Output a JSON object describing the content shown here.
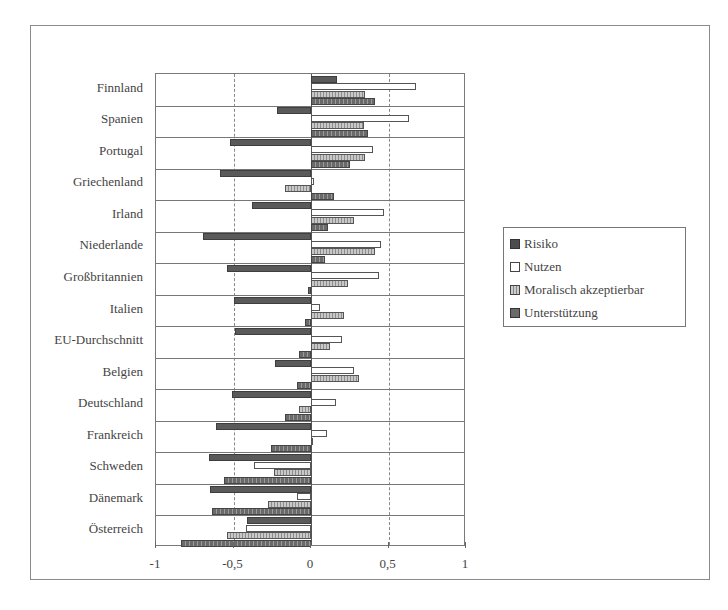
{
  "chart_data": {
    "type": "bar",
    "orientation": "horizontal",
    "title": "",
    "xlabel": "",
    "ylabel": "",
    "xlim": [
      -1,
      1
    ],
    "x_ticks": [
      "-1",
      "-0,5",
      "0",
      "0,5",
      "1"
    ],
    "x_tick_values": [
      -1,
      -0.5,
      0,
      0.5,
      1
    ],
    "grid": "vertical dashed at -0.5 and 0.5",
    "legend_position": "right",
    "categories": [
      "Finnland",
      "Spanien",
      "Portugal",
      "Griechenland",
      "Irland",
      "Niederlande",
      "Großbritannien",
      "Italien",
      "EU-Durchschnitt",
      "Belgien",
      "Deutschland",
      "Frankreich",
      "Schweden",
      "Dänemark",
      "Österreich"
    ],
    "series": [
      {
        "name": "Risiko",
        "values": [
          0.17,
          -0.22,
          -0.52,
          -0.59,
          -0.38,
          -0.7,
          -0.54,
          -0.5,
          -0.49,
          -0.23,
          -0.51,
          -0.61,
          -0.66,
          -0.65,
          -0.41
        ]
      },
      {
        "name": "Nutzen",
        "values": [
          0.68,
          0.63,
          0.4,
          0.02,
          0.47,
          0.45,
          0.44,
          0.06,
          0.2,
          0.28,
          0.16,
          0.1,
          -0.37,
          -0.09,
          -0.42
        ]
      },
      {
        "name": "Moralisch akzeptierbar",
        "values": [
          0.35,
          0.34,
          0.35,
          -0.17,
          0.28,
          0.41,
          0.24,
          0.21,
          0.12,
          0.31,
          -0.08,
          0.0,
          -0.24,
          -0.28,
          -0.54
        ]
      },
      {
        "name": "Unterstützung",
        "values": [
          0.41,
          0.37,
          0.25,
          0.15,
          0.11,
          0.09,
          -0.02,
          -0.04,
          -0.08,
          -0.09,
          -0.17,
          -0.26,
          -0.56,
          -0.64,
          -0.84
        ]
      }
    ]
  },
  "axis": {
    "ticks": [
      "-1",
      "-0,5",
      "0",
      "0,5",
      "1"
    ]
  },
  "legend": {
    "items": [
      "Risiko",
      "Nutzen",
      "Moralisch akzeptierbar",
      "Unterstützung"
    ]
  },
  "labels": {
    "categories": [
      "Finnland",
      "Spanien",
      "Portugal",
      "Griechenland",
      "Irland",
      "Niederlande",
      "Großbritannien",
      "Italien",
      "EU-Durchschnitt",
      "Belgien",
      "Deutschland",
      "Frankreich",
      "Schweden",
      "Dänemark",
      "Österreich"
    ]
  }
}
